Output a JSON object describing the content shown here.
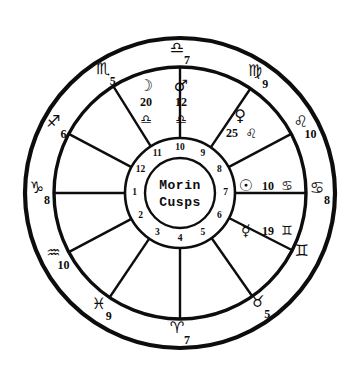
{
  "chart_data": {
    "type": "wheel",
    "title": "Morin Cusps",
    "center_label_line1": "Morin",
    "center_label_line2": "Cusps",
    "rings": [
      "zodiac-ring",
      "house-ring",
      "cusp-number-ring",
      "center-hub"
    ],
    "zodiac_signs": [
      {
        "name": "libra",
        "glyph": "♎",
        "degree": "7",
        "angle_deg": 270
      },
      {
        "name": "virgo",
        "glyph": "♍",
        "degree": "9",
        "angle_deg": 304
      },
      {
        "name": "leo",
        "glyph": "♌",
        "degree": "10",
        "angle_deg": 332
      },
      {
        "name": "cancer",
        "glyph": "♋",
        "degree": "8",
        "angle_deg": 0
      },
      {
        "name": "gemini",
        "glyph": "♊",
        "degree": "",
        "angle_deg": 27
      },
      {
        "name": "taurus",
        "glyph": "♉",
        "degree": "5",
        "angle_deg": 55
      },
      {
        "name": "aries",
        "glyph": "♈",
        "degree": "7",
        "angle_deg": 90
      },
      {
        "name": "pisces",
        "glyph": "♓",
        "degree": "9",
        "angle_deg": 124
      },
      {
        "name": "aquarius",
        "glyph": "♒",
        "degree": "10",
        "angle_deg": 152
      },
      {
        "name": "capricorn",
        "glyph": "♑",
        "degree": "8",
        "angle_deg": 180
      },
      {
        "name": "sagittarius",
        "glyph": "♐",
        "degree": "6",
        "angle_deg": 208
      },
      {
        "name": "scorpio",
        "glyph": "♏",
        "degree": "5",
        "angle_deg": 238
      }
    ],
    "planets": [
      {
        "name": "moon",
        "glyph": "☽",
        "degree": "20",
        "sign_glyph": "♎",
        "sign_name": "libra",
        "x": 146,
        "y": 86
      },
      {
        "name": "mars",
        "glyph": "♂",
        "degree": "12",
        "sign_glyph": "♎",
        "sign_name": "libra",
        "x": 181,
        "y": 86
      },
      {
        "name": "venus",
        "glyph": "♀",
        "degree": "25",
        "sign_glyph": "♌",
        "sign_name": "leo",
        "x": 240,
        "y": 116
      },
      {
        "name": "sun",
        "glyph": "☉",
        "degree": "10",
        "sign_glyph": "♋",
        "sign_name": "cancer",
        "x": 268,
        "y": 186
      },
      {
        "name": "mercury",
        "glyph": "☿",
        "degree": "19",
        "sign_glyph": "♊",
        "sign_name": "gemini",
        "x": 268,
        "y": 231
      }
    ],
    "house_numbers": [
      "1",
      "2",
      "3",
      "4",
      "5",
      "6",
      "7",
      "8",
      "9",
      "10",
      "11",
      "12"
    ],
    "house_number_angles": [
      180,
      150,
      120,
      90,
      60,
      30,
      0,
      330,
      300,
      270,
      240,
      210
    ],
    "cusp_angles_deg": [
      180,
      152,
      124,
      90,
      55,
      27,
      0,
      332,
      304,
      270,
      238,
      208
    ]
  },
  "colors": {
    "ink": "#0d0d0d",
    "paper": "#ffffff"
  }
}
